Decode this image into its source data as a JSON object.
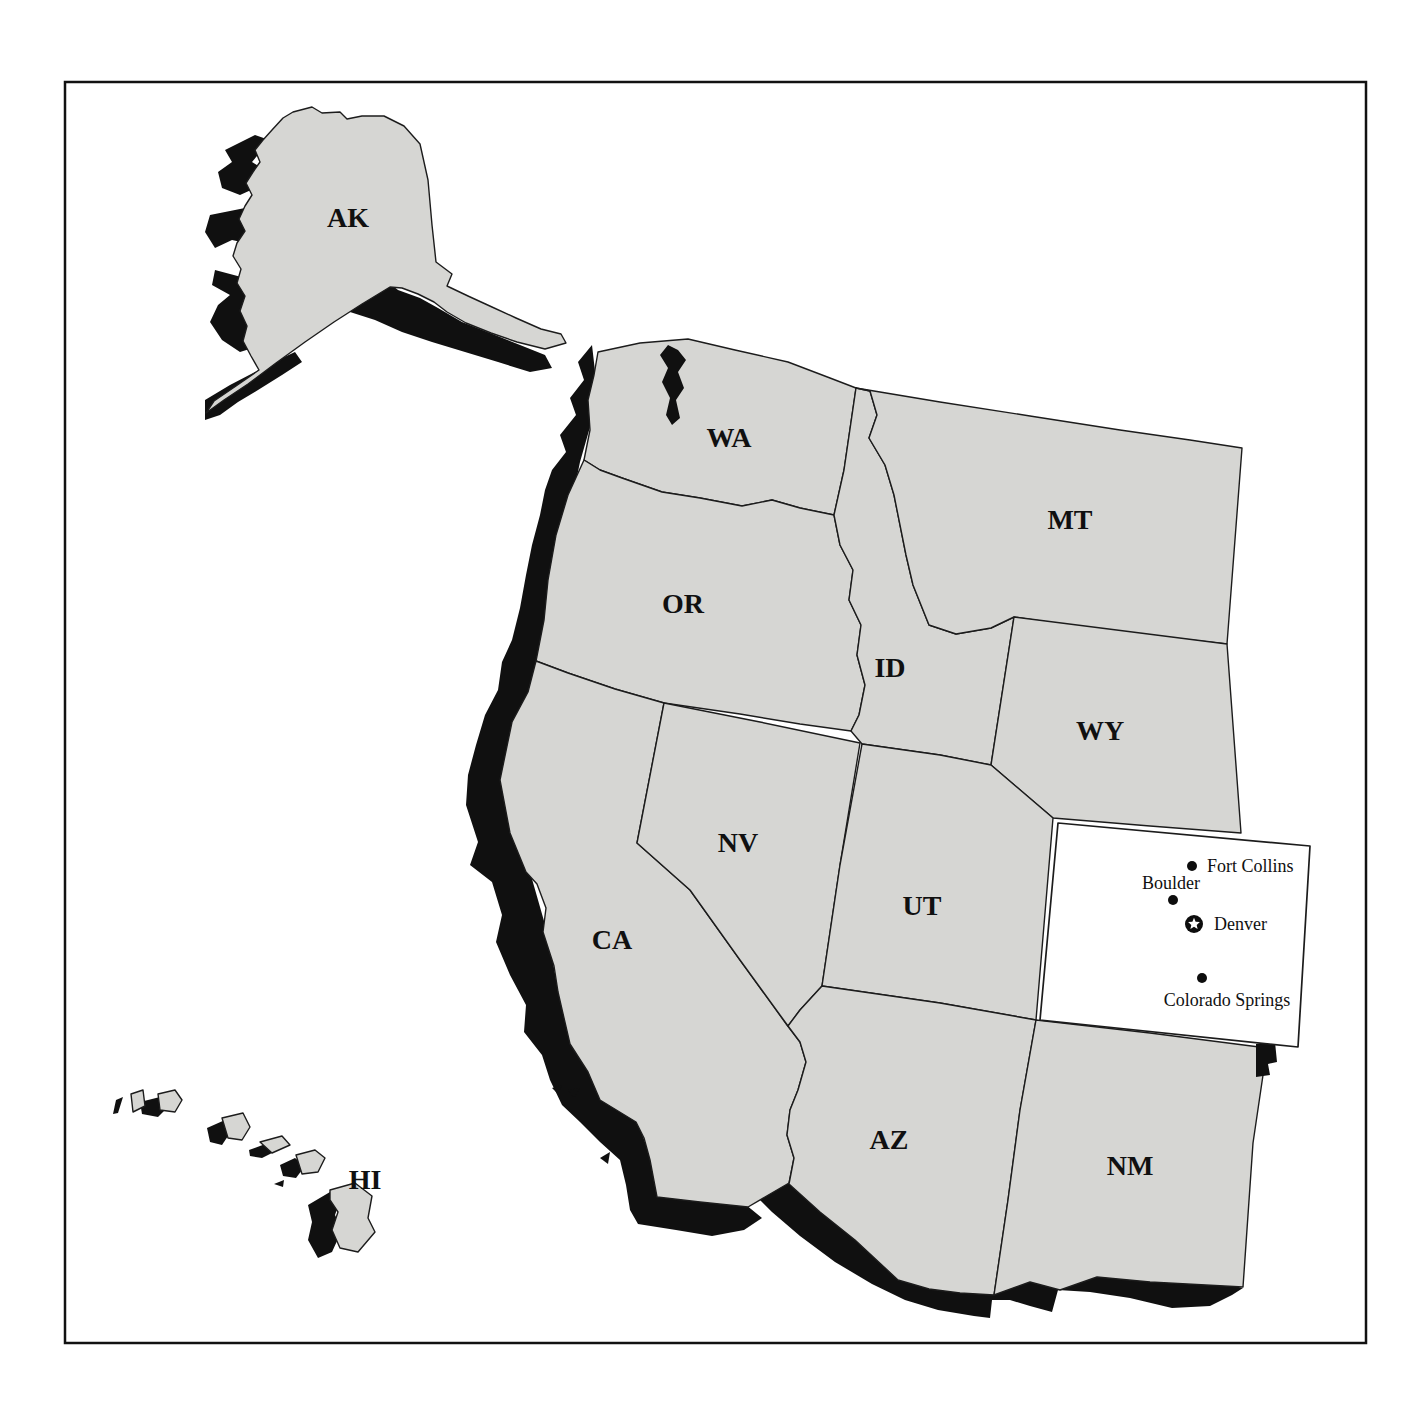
{
  "map": {
    "state_labels": {
      "ak": "AK",
      "hi": "HI",
      "wa": "WA",
      "or": "OR",
      "ca": "CA",
      "nv": "NV",
      "id": "ID",
      "mt": "MT",
      "wy": "WY",
      "ut": "UT",
      "az": "AZ",
      "nm": "NM"
    },
    "highlighted_state": "CO",
    "cities": {
      "fort_collins": {
        "name": "Fort Collins",
        "marker": "dot"
      },
      "boulder": {
        "name": "Boulder",
        "marker": "dot"
      },
      "denver": {
        "name": "Denver",
        "marker": "star"
      },
      "colorado_springs": {
        "name": "Colorado Springs",
        "marker": "dot"
      }
    },
    "colors": {
      "land": "#d6d6d3",
      "shadow": "#101010",
      "highlight": "#ffffff",
      "line": "#1c1c1c",
      "background": "#ffffff"
    }
  }
}
